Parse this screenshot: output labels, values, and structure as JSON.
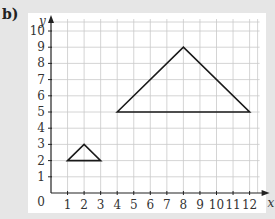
{
  "part_label": "b)",
  "chart_data": {
    "type": "line",
    "title": "",
    "xlabel": "x",
    "ylabel": "y",
    "xlim": [
      0,
      12
    ],
    "ylim": [
      0,
      10
    ],
    "x_ticks": [
      1,
      2,
      3,
      4,
      5,
      6,
      7,
      8,
      9,
      10,
      11,
      12
    ],
    "y_ticks": [
      1,
      2,
      3,
      4,
      5,
      6,
      7,
      8,
      9,
      10
    ],
    "origin_label": "0",
    "grid": true,
    "series": [
      {
        "name": "small triangle",
        "points": [
          [
            1,
            2
          ],
          [
            2,
            3
          ],
          [
            3,
            2
          ]
        ],
        "closed": true
      },
      {
        "name": "large triangle",
        "points": [
          [
            4,
            5
          ],
          [
            8,
            9
          ],
          [
            12,
            5
          ]
        ],
        "closed": true
      }
    ]
  }
}
